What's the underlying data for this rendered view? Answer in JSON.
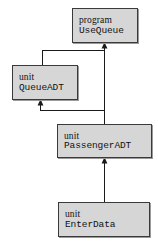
{
  "diagram": {
    "type": "dependency-graph",
    "background_color": "#ffffff",
    "node_fill_color": "#d6d6d6",
    "node_border_color": "#3a3a3a",
    "edge_color": "#1a1a1a",
    "nodes": [
      {
        "id": "usequeue",
        "kind": "program",
        "line1": "program",
        "line2": "UseQueue"
      },
      {
        "id": "queueadt",
        "kind": "unit",
        "line1": "unit",
        "line2": "QueueADT"
      },
      {
        "id": "passengeradt",
        "kind": "unit",
        "line1": "unit",
        "line2": "PassengerADT"
      },
      {
        "id": "enterdata",
        "kind": "unit",
        "line1": "unit",
        "line2": "EnterData"
      }
    ],
    "edges": [
      {
        "id": "queueadt-to-usequeue",
        "from": "queueadt",
        "to": "usequeue",
        "style": "elbow",
        "arrowhead": "up"
      },
      {
        "id": "passengeradt-to-usequeue",
        "from": "passengeradt",
        "to": "usequeue",
        "style": "straight",
        "arrowhead": "up"
      },
      {
        "id": "passengeradt-to-queueadt",
        "from": "passengeradt",
        "to": "queueadt",
        "style": "elbow",
        "arrowhead": "up"
      },
      {
        "id": "enterdata-to-passengeradt",
        "from": "enterdata",
        "to": "passengeradt",
        "style": "straight",
        "arrowhead": "up"
      }
    ]
  }
}
